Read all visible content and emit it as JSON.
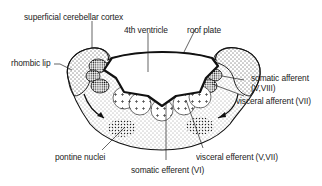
{
  "diagram": {
    "labels": {
      "superficial_cortex": "superficial cerebellar cortex",
      "ventricle": "4th ventricle",
      "roof_plate": "roof plate",
      "rhombic_lip": "rhombic lip",
      "somatic_afferent": "somatic afferent",
      "somatic_afferent_nerves": "(V,VIII)",
      "visceral_afferent": "visceral afferent (VII)",
      "pontine_nuclei": "pontine nuclei",
      "visceral_efferent": "visceral efferent (V,VII)",
      "somatic_efferent": "somatic efferent (VI)"
    },
    "colors": {
      "ink": "#111111",
      "background": "#ffffff"
    }
  }
}
